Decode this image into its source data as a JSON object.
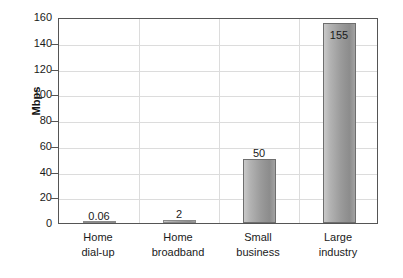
{
  "chart_data": {
    "type": "bar",
    "title": "",
    "subtitle": "",
    "xlabel": "",
    "ylabel": "Mbps",
    "ylim": [
      0,
      160
    ],
    "yticks": [
      0,
      20,
      40,
      60,
      80,
      100,
      120,
      140,
      160
    ],
    "ytick_labels": [
      "0",
      "20",
      "40",
      "60",
      "80",
      "100",
      "120",
      "140",
      "160"
    ],
    "grid": "both",
    "legend": "none",
    "categories": [
      "Home dial-up",
      "Home broadband",
      "Small business",
      "Large industry"
    ],
    "category_lines": [
      [
        "Home",
        "dial-up"
      ],
      [
        "Home",
        "broadband"
      ],
      [
        "Small",
        "business"
      ],
      [
        "Large",
        "industry"
      ]
    ],
    "values": [
      0.06,
      2,
      50,
      155
    ],
    "value_labels": [
      "0.06",
      "2",
      "50",
      "155"
    ],
    "label_placement": [
      "above",
      "above",
      "above",
      "inside-top"
    ],
    "series": [
      {
        "name": "Bandwidth",
        "values": [
          0.06,
          2,
          50,
          155
        ]
      }
    ],
    "colors": {
      "bar_light": "#c9c9c9",
      "bar_dark": "#8c8c8c",
      "bar_outline": "#6e6e6e",
      "frame": "#555555",
      "gridline": "#dcdcdc",
      "text": "#1a1a1a",
      "background": "#ffffff"
    }
  }
}
